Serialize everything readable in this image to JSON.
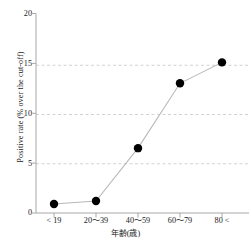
{
  "chart_data": {
    "type": "line",
    "title": "",
    "xlabel": "年齢(歳)",
    "ylabel": "Positive rate (% over the cut-off)",
    "categories": [
      "< 19",
      "20〜39",
      "40〜59",
      "60〜79",
      "80 <"
    ],
    "values": [
      0.9,
      1.2,
      6.5,
      13.0,
      15.1
    ],
    "yticks": [
      "0",
      "5",
      "10",
      "15",
      "20"
    ],
    "ytick_values": [
      0,
      5,
      10,
      15,
      20
    ],
    "ylim": [
      0,
      20
    ],
    "grid": "horizontal-dashed",
    "gridlines_at": [
      5,
      10,
      15
    ],
    "legend": "none",
    "marker": "filled-circle",
    "marker_color": "#000000",
    "line_color": "#b4b4b4",
    "grid_color": "#c8c8c8",
    "axis_color": "#aaaaaa"
  },
  "axes": {
    "y_title": "Positive rate (% over the cut-off)",
    "x_title": "年齢(歳)"
  }
}
